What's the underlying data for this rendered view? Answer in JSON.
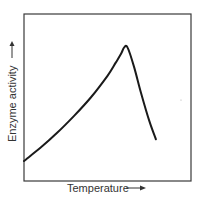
{
  "chart_data": {
    "type": "line",
    "title": "",
    "xlabel": "Temperature",
    "ylabel": "Enzyme activity",
    "xlabel_arrow": "right",
    "ylabel_arrow": "up",
    "xlim": [
      0,
      1
    ],
    "ylim": [
      0,
      1
    ],
    "grid": false,
    "ticks": false,
    "legend": null,
    "series": [
      {
        "name": "Enzyme activity vs temperature",
        "x": [
          0.0,
          0.1,
          0.2,
          0.3,
          0.4,
          0.5,
          0.55,
          0.58,
          0.6,
          0.62,
          0.66,
          0.7,
          0.75,
          0.79
        ],
        "y": [
          0.12,
          0.2,
          0.29,
          0.39,
          0.5,
          0.63,
          0.71,
          0.76,
          0.8,
          0.8,
          0.68,
          0.53,
          0.36,
          0.25
        ]
      }
    ],
    "annotations": [
      "Optimum temperature at curve peak"
    ]
  }
}
